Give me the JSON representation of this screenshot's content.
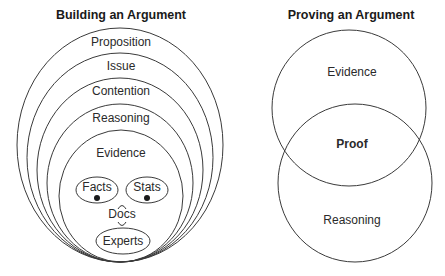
{
  "left": {
    "title": "Building an Argument",
    "layers": [
      "Proposition",
      "Issue",
      "Contention",
      "Reasoning",
      "Evidence"
    ],
    "items": {
      "facts": "Facts",
      "stats": "Stats",
      "docs": "Docs",
      "experts": "Experts"
    }
  },
  "right": {
    "title": "Proving an Argument",
    "top_circle": "Evidence",
    "bottom_circle": "Reasoning",
    "overlap": "Proof"
  },
  "colors": {
    "stroke": "#3a3a3a",
    "text": "#2a2a2a"
  }
}
